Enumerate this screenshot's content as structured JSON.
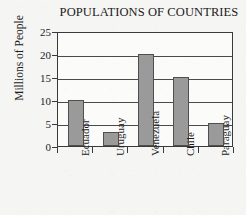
{
  "chart_data": {
    "type": "bar",
    "title": "POPULATIONS OF COUNTRIES",
    "xlabel": "",
    "ylabel": "Millions of People",
    "categories": [
      "Ecuador",
      "Uruguay",
      "Venezuela",
      "Chile",
      "Paraguay"
    ],
    "values": [
      10,
      3,
      20,
      15,
      5
    ],
    "ylim": [
      0,
      25
    ],
    "ytick_labels": [
      "0",
      "5",
      "10",
      "15",
      "20",
      "25"
    ],
    "ytick_values": [
      0,
      5,
      10,
      15,
      20,
      25
    ],
    "grid": "horizontal",
    "legend": "none",
    "bar_color": "#9a9a9a",
    "bar_border_color": "#4f4f4f",
    "axis_color": "#3a3a3a",
    "plot_background": "#fbfbfa",
    "page_background": "#f5f5f4",
    "text_color": "#1b1b1b"
  }
}
